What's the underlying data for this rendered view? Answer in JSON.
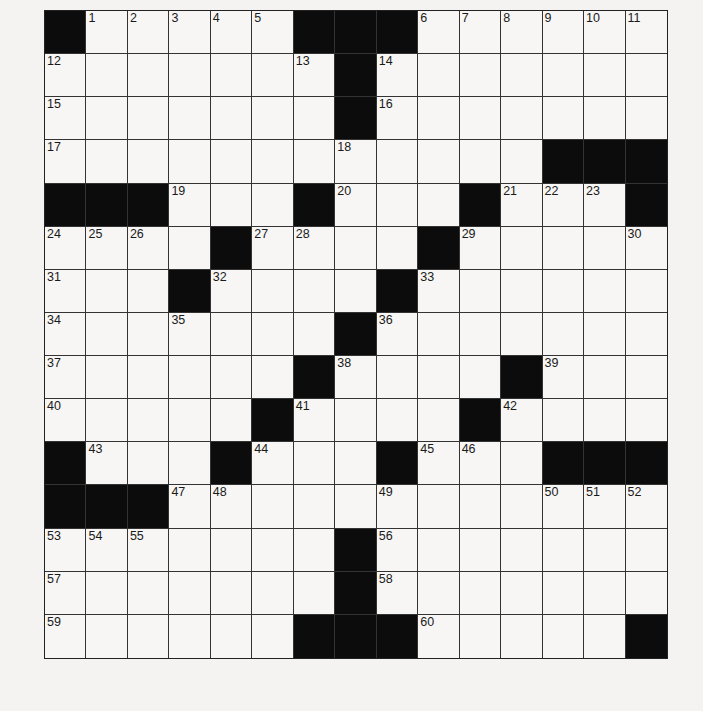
{
  "edge_mark": ")",
  "puzzle": {
    "rows": 15,
    "cols": 15,
    "layout": [
      "#.....###......",
      ".......#.......",
      ".......#.......",
      "............###",
      "###...#...#...#",
      "....#....#.....",
      "...#....#......",
      ".......#.......",
      "......#....#...",
      ".....#....#....",
      "#...#...#...###",
      "###............",
      ".......#.......",
      ".......#.......",
      "......###.....#"
    ],
    "numbers": [
      [
        0,
        1,
        1
      ],
      [
        0,
        2,
        2
      ],
      [
        0,
        3,
        3
      ],
      [
        0,
        4,
        4
      ],
      [
        0,
        5,
        5
      ],
      [
        0,
        9,
        6
      ],
      [
        0,
        10,
        7
      ],
      [
        0,
        11,
        8
      ],
      [
        0,
        12,
        9
      ],
      [
        0,
        13,
        10
      ],
      [
        0,
        14,
        11
      ],
      [
        1,
        0,
        12
      ],
      [
        1,
        6,
        13
      ],
      [
        1,
        8,
        14
      ],
      [
        2,
        0,
        15
      ],
      [
        2,
        8,
        16
      ],
      [
        3,
        0,
        17
      ],
      [
        3,
        7,
        18
      ],
      [
        4,
        3,
        19
      ],
      [
        4,
        7,
        20
      ],
      [
        4,
        11,
        21
      ],
      [
        4,
        12,
        22
      ],
      [
        4,
        13,
        23
      ],
      [
        5,
        0,
        24
      ],
      [
        5,
        1,
        25
      ],
      [
        5,
        2,
        26
      ],
      [
        5,
        5,
        27
      ],
      [
        5,
        6,
        28
      ],
      [
        5,
        10,
        29
      ],
      [
        5,
        14,
        30
      ],
      [
        6,
        0,
        31
      ],
      [
        6,
        4,
        32
      ],
      [
        6,
        9,
        33
      ],
      [
        7,
        0,
        34
      ],
      [
        7,
        3,
        35
      ],
      [
        7,
        8,
        36
      ],
      [
        8,
        0,
        37
      ],
      [
        8,
        7,
        38
      ],
      [
        8,
        12,
        39
      ],
      [
        9,
        0,
        40
      ],
      [
        9,
        6,
        41
      ],
      [
        9,
        11,
        42
      ],
      [
        10,
        1,
        43
      ],
      [
        10,
        5,
        44
      ],
      [
        10,
        9,
        45
      ],
      [
        10,
        10,
        46
      ],
      [
        11,
        3,
        47
      ],
      [
        11,
        4,
        48
      ],
      [
        11,
        8,
        49
      ],
      [
        11,
        12,
        50
      ],
      [
        11,
        13,
        51
      ],
      [
        11,
        14,
        52
      ],
      [
        12,
        0,
        53
      ],
      [
        12,
        1,
        54
      ],
      [
        12,
        2,
        55
      ],
      [
        12,
        8,
        56
      ],
      [
        13,
        0,
        57
      ],
      [
        13,
        8,
        58
      ],
      [
        14,
        0,
        59
      ],
      [
        14,
        9,
        60
      ]
    ]
  }
}
